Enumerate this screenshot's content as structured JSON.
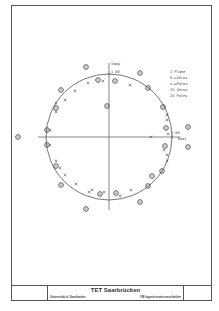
{
  "diagram": {
    "type": "pole-zero plot",
    "axes": {
      "imag_label": "Imag",
      "real_label": "Real",
      "imag_tick": "1.00",
      "real_tick": "1.00"
    },
    "legend": {
      "title": "Z-Plane",
      "zeros_label": "O:=Zeros",
      "poles_label": "x:=Poles",
      "zeros_count": "25 Zeros",
      "poles_count": "25 Poles"
    },
    "unit_circle": {
      "cx": 109,
      "cy": 137,
      "r": 63
    },
    "zeros": [
      [
        86,
        67
      ],
      [
        140,
        73
      ],
      [
        98,
        80
      ],
      [
        115,
        81
      ],
      [
        61,
        90
      ],
      [
        148,
        88
      ],
      [
        56,
        108
      ],
      [
        107,
        106
      ],
      [
        163,
        107
      ],
      [
        166,
        128
      ],
      [
        188,
        127
      ],
      [
        18,
        137
      ],
      [
        47,
        130
      ],
      [
        47,
        145
      ],
      [
        165,
        146
      ],
      [
        188,
        147
      ],
      [
        56,
        166
      ],
      [
        162,
        171
      ],
      [
        61,
        185
      ],
      [
        148,
        186
      ],
      [
        100,
        194
      ],
      [
        116,
        193
      ],
      [
        140,
        202
      ],
      [
        86,
        209
      ],
      [
        152,
        176
      ]
    ],
    "poles": [
      [
        103,
        81
      ],
      [
        88,
        83
      ],
      [
        130,
        85
      ],
      [
        75,
        91
      ],
      [
        65,
        100
      ],
      [
        56,
        112
      ],
      [
        167,
        115
      ],
      [
        167,
        120
      ],
      [
        50,
        130
      ],
      [
        151,
        137
      ],
      [
        50,
        145
      ],
      [
        56,
        161
      ],
      [
        65,
        175
      ],
      [
        76,
        184
      ],
      [
        167,
        155
      ],
      [
        167,
        161
      ],
      [
        89,
        192
      ],
      [
        104,
        192
      ],
      [
        131,
        190
      ],
      [
        56,
        103
      ],
      [
        60,
        168
      ],
      [
        168,
        134
      ],
      [
        164,
        150
      ],
      [
        92,
        190
      ],
      [
        120,
        196
      ]
    ]
  },
  "title_block": {
    "title": "TET Saarbrücken",
    "left_text": "Universität d. Saarlandes",
    "right_text": "FB Ingenieurwissenschaften"
  },
  "colors": {
    "ink": "#444444",
    "background": "#ffffff"
  }
}
